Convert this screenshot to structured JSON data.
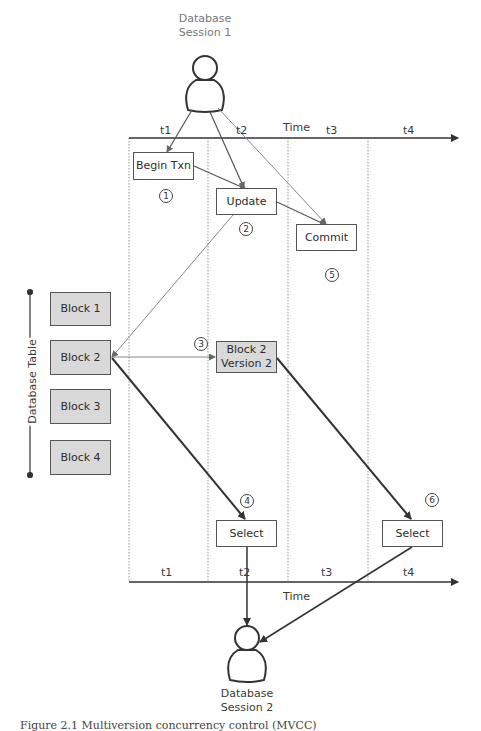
{
  "figure": {
    "caption": "Figure 2.1 Multiversion concurrency control (MVCC)",
    "session_top": {
      "line1": "Database",
      "line2": "Session 1",
      "icon": "person-icon"
    },
    "session_bottom": {
      "line1": "Database",
      "line2": "Session 2",
      "icon": "person-icon"
    },
    "time_axis_top": {
      "label": "Time",
      "periods": [
        "t1",
        "t2",
        "t3",
        "t4"
      ]
    },
    "time_axis_bottom": {
      "label": "Time",
      "periods": [
        "t1",
        "t2",
        "t3",
        "t4"
      ]
    },
    "database_table": {
      "label": "Database Table",
      "blocks": [
        "Block 1",
        "Block 2",
        "Block 3",
        "Block 4"
      ]
    },
    "operations": {
      "begin_txn": "Begin Txn",
      "update": "Update",
      "commit": "Commit",
      "block2_v2_line1": "Block 2",
      "block2_v2_line2": "Version 2",
      "select_t2": "Select",
      "select_t4": "Select"
    },
    "steps": [
      "1",
      "2",
      "3",
      "4",
      "5",
      "6"
    ],
    "colors": {
      "block_fill": "#d9d9d9",
      "line": "#333333",
      "thin_line": "#888888",
      "grid": "#999999"
    }
  }
}
